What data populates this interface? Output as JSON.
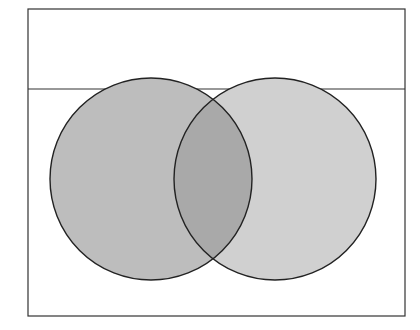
{
  "diagram": {
    "type": "venn",
    "frame": {
      "x": 28,
      "y": 9,
      "width": 377,
      "height": 307,
      "stroke": "#333333"
    },
    "divider": {
      "y": 89
    },
    "sets": [
      {
        "name": "set-a",
        "cx": 151,
        "cy": 179,
        "r": 101,
        "fill": "#bdbdbd"
      },
      {
        "name": "set-b",
        "cx": 275,
        "cy": 179,
        "r": 101,
        "fill": "#d0d0d0"
      }
    ],
    "intersection_fill": "#a9a9a9",
    "stroke": "#222222"
  }
}
